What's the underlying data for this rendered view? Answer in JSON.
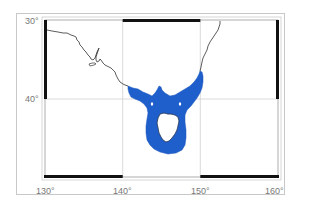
{
  "map": {
    "projection": "equirectangular",
    "extent": {
      "lon_min": 130,
      "lon_max": 160,
      "lat_min": -50,
      "lat_max": -30
    },
    "colors": {
      "background": "#ffffff",
      "coastline": "#333333",
      "highlight_region": "#1f5fcc",
      "gridline": "#d0d0d0",
      "frame_black": "#111111",
      "outer_frame": "#c8c8c8",
      "label": "#777777"
    },
    "highlight_region_name": "blue shaded region around Bass Strait and Tasmania"
  },
  "axes": {
    "lat_labels": [
      "30°",
      "40°"
    ],
    "lon_labels": [
      "130°",
      "140°",
      "150°",
      "160°"
    ]
  }
}
